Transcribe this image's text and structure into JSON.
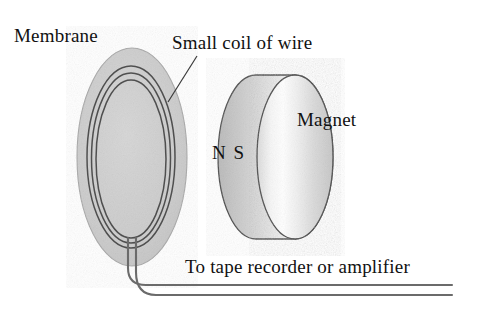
{
  "figure": {
    "type": "diagram",
    "background_color": "#ffffff",
    "labels": {
      "membrane": "Membrane",
      "coil": "Small coil of wire",
      "magnet": "Magnet",
      "poles": "N S",
      "output": "To tape recorder or amplifier"
    },
    "parts": [
      {
        "name": "membrane",
        "shape": "ellipse",
        "label": "Membrane",
        "fill_color": "#cdcdcd",
        "stroke_color": "#9a9a9a"
      },
      {
        "name": "coil",
        "shape": "concentric-ellipses",
        "label": "Small coil of wire",
        "turns": 3,
        "stroke_color": "#5a5a5a"
      },
      {
        "name": "magnet",
        "shape": "cylinder",
        "label": "Magnet",
        "poles": "N S",
        "body_color": "#c9c9c9",
        "face_highlight_color": "#ffffff",
        "stroke_color": "#4a4a4a"
      },
      {
        "name": "lead-wires",
        "shape": "twin-line",
        "label": "To tape recorder or amplifier",
        "stroke_color": "#6d6d6d"
      }
    ]
  }
}
